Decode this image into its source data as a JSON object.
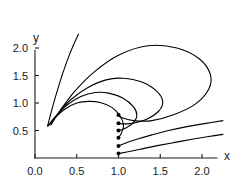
{
  "chart_data": {
    "type": "line",
    "title": "",
    "subtitle": "",
    "xlabel": "x",
    "ylabel": "y",
    "xlim": [
      0.0,
      2.25
    ],
    "ylim": [
      0.0,
      2.25
    ],
    "grid": false,
    "legend": null,
    "x_ticks": [
      "0.0",
      "0.5",
      "1.0",
      "1.5",
      "2.0"
    ],
    "x_tick_values": [
      0.0,
      0.5,
      1.0,
      1.5,
      2.0
    ],
    "y_ticks": [
      "0.5",
      "1.0",
      "1.5",
      "2.0"
    ],
    "y_tick_values": [
      0.5,
      1.0,
      1.5,
      2.0
    ],
    "annotations": [],
    "seed_points": {
      "label": "trajectory start markers on the line x = 1.0",
      "x": [
        1.0,
        1.0,
        1.0,
        1.0,
        1.0,
        1.0
      ],
      "y": [
        0.78,
        0.63,
        0.5,
        0.37,
        0.22,
        0.08
      ]
    },
    "series": [
      {
        "name": "curve-1-outer-loop",
        "comment": "largest loop: rises from lower-left focus, peaks near y=2.05 at x=1.35, sweeps right to x=2.1 then down to the seed at (1.0, 0.78)",
        "x": [
          0.19,
          0.3,
          0.48,
          0.72,
          1.0,
          1.35,
          1.7,
          1.97,
          2.1,
          2.08,
          1.92,
          1.65,
          1.4,
          1.18,
          1.04,
          1.0
        ],
        "y": [
          0.6,
          0.86,
          1.22,
          1.58,
          1.87,
          2.04,
          2.0,
          1.8,
          1.52,
          1.25,
          0.98,
          0.78,
          0.68,
          0.68,
          0.73,
          0.78
        ]
      },
      {
        "name": "curve-2",
        "comment": "second loop: peaks near y=1.46 at x=1.0, turns at x=1.55, returns to seed (1.0, 0.63)",
        "x": [
          0.17,
          0.27,
          0.42,
          0.62,
          0.85,
          1.05,
          1.28,
          1.46,
          1.53,
          1.48,
          1.33,
          1.16,
          1.04,
          1.0
        ],
        "y": [
          0.6,
          0.8,
          1.05,
          1.27,
          1.42,
          1.45,
          1.38,
          1.21,
          1.02,
          0.85,
          0.7,
          0.63,
          0.62,
          0.63
        ]
      },
      {
        "name": "curve-3",
        "comment": "third loop: peaks near y=1.19 at x=0.80, turns at x=1.22, returns to seed (1.0, 0.50)",
        "x": [
          0.16,
          0.25,
          0.38,
          0.55,
          0.72,
          0.88,
          1.05,
          1.18,
          1.22,
          1.17,
          1.08,
          1.01,
          1.0
        ],
        "y": [
          0.59,
          0.76,
          0.96,
          1.12,
          1.19,
          1.18,
          1.09,
          0.93,
          0.77,
          0.63,
          0.54,
          0.5,
          0.5
        ]
      },
      {
        "name": "curve-4",
        "comment": "fourth loop: peaks near y=1.03 at x=0.68, narrow turn at x=1.06, returns to seed (1.0, 0.37)",
        "x": [
          0.155,
          0.24,
          0.36,
          0.5,
          0.64,
          0.78,
          0.92,
          1.02,
          1.06,
          1.04,
          1.01,
          1.0
        ],
        "y": [
          0.585,
          0.73,
          0.89,
          1.0,
          1.03,
          1.01,
          0.92,
          0.76,
          0.6,
          0.47,
          0.39,
          0.37
        ]
      },
      {
        "name": "curve-5-steep",
        "comment": "open curve leaving the focus steeply upward toward the top-left, exits plot near x=0.52, y=2.25",
        "x": [
          0.15,
          0.18,
          0.22,
          0.27,
          0.33,
          0.4,
          0.46,
          0.52
        ],
        "y": [
          0.58,
          0.75,
          0.98,
          1.24,
          1.53,
          1.83,
          2.05,
          2.25
        ]
      },
      {
        "name": "curve-6-lower-right-upper",
        "comment": "open curve from seed (1.0, 0.22) sweeping right and up, exits plot near x=2.25, y=0.66",
        "x": [
          1.0,
          1.08,
          1.22,
          1.4,
          1.6,
          1.82,
          2.05,
          2.25
        ],
        "y": [
          0.22,
          0.27,
          0.34,
          0.42,
          0.5,
          0.57,
          0.63,
          0.68
        ]
      },
      {
        "name": "curve-7-lower-right-lower",
        "comment": "open curve from seed (1.0, 0.08) sweeping right and up, exits plot near x=2.25, y=0.42",
        "x": [
          1.0,
          1.1,
          1.26,
          1.45,
          1.66,
          1.88,
          2.08,
          2.25
        ],
        "y": [
          0.08,
          0.11,
          0.16,
          0.22,
          0.28,
          0.34,
          0.39,
          0.43
        ]
      }
    ]
  },
  "figure": {
    "x_axis_label": "x",
    "y_axis_label": "y"
  },
  "colors": {
    "curve": "#000000",
    "axis": "#1a1a1a",
    "background": "#ffffff"
  }
}
